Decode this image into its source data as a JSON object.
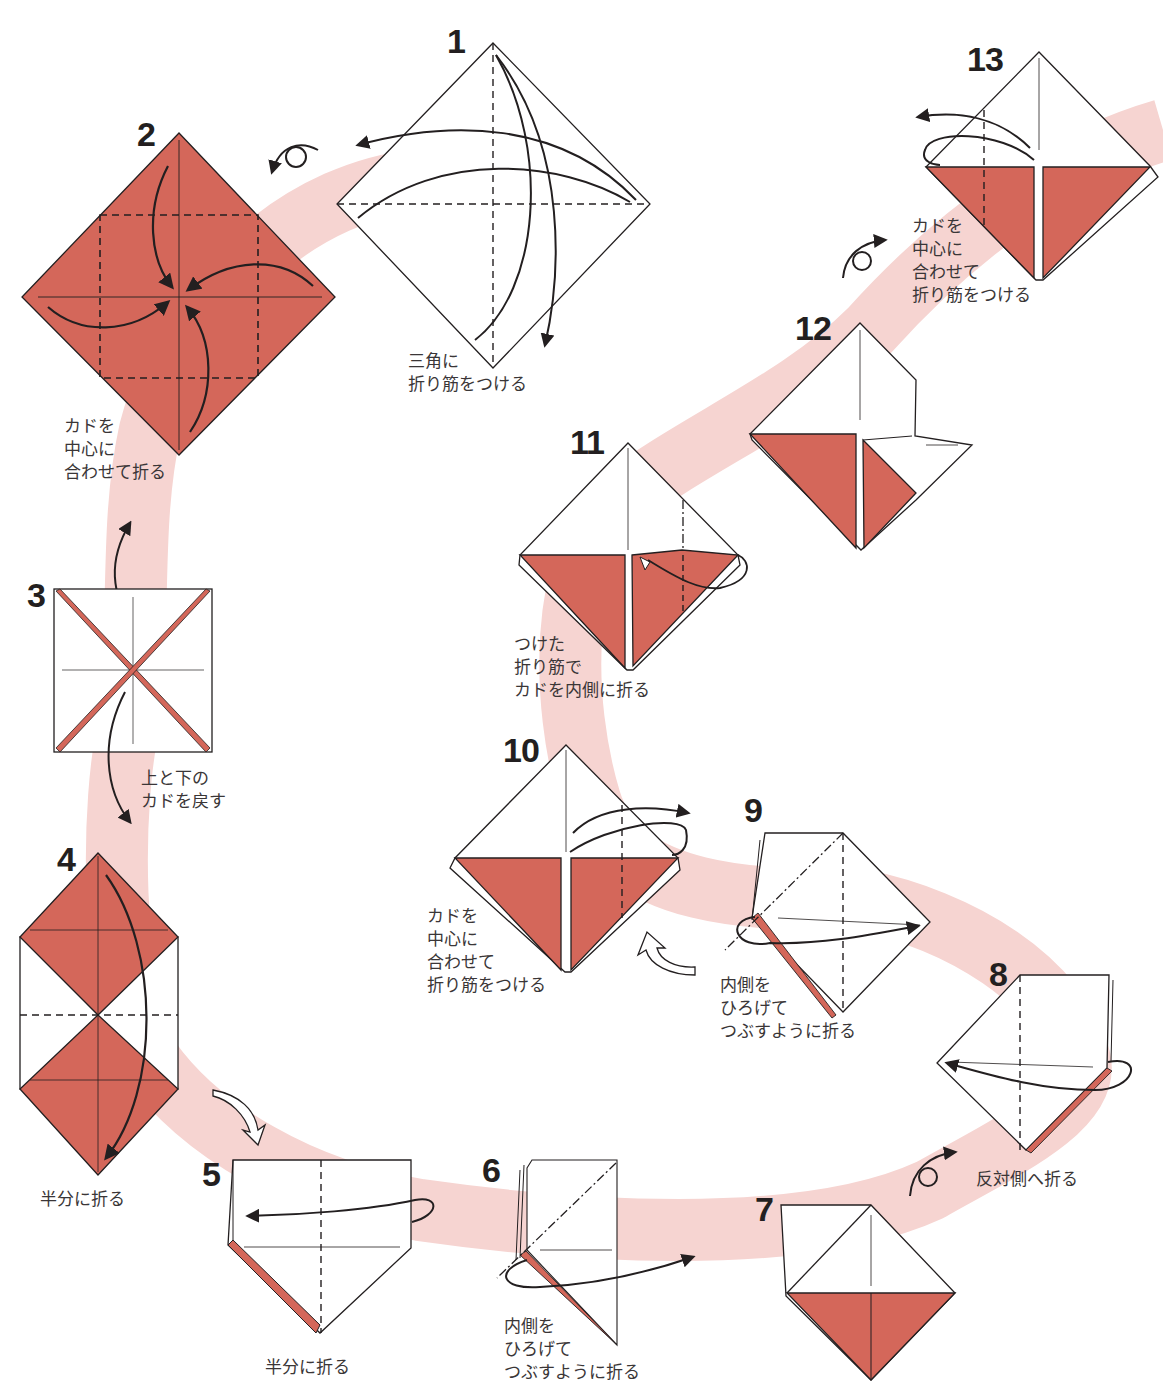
{
  "diagram": {
    "type": "origami-instruction-sheet",
    "colors": {
      "paper_color": "#d4675a",
      "paper_white": "#ffffff",
      "path_band": "#f6d4d1",
      "line": "#231f20",
      "text": "#3a3637"
    },
    "steps": [
      {
        "number": "1",
        "caption": "三角に\n折り筋をつける"
      },
      {
        "number": "2",
        "caption": "カドを\n中心に\n合わせて折る"
      },
      {
        "number": "3",
        "caption": "上と下の\nカドを戻す"
      },
      {
        "number": "4",
        "caption": "半分に折る"
      },
      {
        "number": "5",
        "caption": "半分に折る"
      },
      {
        "number": "6",
        "caption": "内側を\nひろげて\nつぶすように折る"
      },
      {
        "number": "7",
        "caption": ""
      },
      {
        "number": "8",
        "caption": "反対側へ折る"
      },
      {
        "number": "9",
        "caption": "内側を\nひろげて\nつぶすように折る"
      },
      {
        "number": "10",
        "caption": "カドを\n中心に\n合わせて\n折り筋をつける"
      },
      {
        "number": "11",
        "caption": "つけた\n折り筋で\nカドを内側に折る"
      },
      {
        "number": "12",
        "caption": ""
      },
      {
        "number": "13",
        "caption": "カドを\n中心に\n合わせて\n折り筋をつける"
      }
    ],
    "symbols": [
      "turn-over-icon",
      "valley-fold-line",
      "mountain-fold-line",
      "fold-arrow",
      "next-step-hollow-arrow"
    ]
  }
}
